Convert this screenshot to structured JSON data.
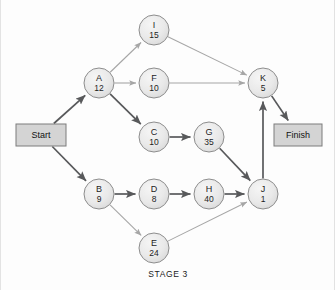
{
  "figure": {
    "caption": "STAGE 3",
    "width": 335,
    "height": 290,
    "background_color": "#fdfdfd",
    "node_fill_color": "#e8e8e8",
    "node_stroke_color": "#8d8d8d",
    "terminal_fill_color": "#d4d4d4",
    "edge_light_color": "#a6a6a6",
    "edge_bold_color": "#58595b"
  },
  "terminals": [
    {
      "id": "start",
      "label": "Start",
      "x": 40,
      "y": 135,
      "w": 50,
      "h": 22
    },
    {
      "id": "finish",
      "label": "Finish",
      "x": 297,
      "y": 135,
      "w": 48,
      "h": 22
    }
  ],
  "nodes": [
    {
      "id": "I",
      "label": "I",
      "value": "15",
      "x": 153,
      "y": 30,
      "r": 15
    },
    {
      "id": "A",
      "label": "A",
      "value": "12",
      "x": 98,
      "y": 83,
      "r": 15
    },
    {
      "id": "F",
      "label": "F",
      "value": "10",
      "x": 153,
      "y": 83,
      "r": 15
    },
    {
      "id": "K",
      "label": "K",
      "value": "5",
      "x": 262,
      "y": 83,
      "r": 15
    },
    {
      "id": "C",
      "label": "C",
      "value": "10",
      "x": 153,
      "y": 137,
      "r": 15
    },
    {
      "id": "G",
      "label": "G",
      "value": "35",
      "x": 208,
      "y": 137,
      "r": 15
    },
    {
      "id": "B",
      "label": "B",
      "value": "9",
      "x": 98,
      "y": 194,
      "r": 15
    },
    {
      "id": "D",
      "label": "D",
      "value": "8",
      "x": 153,
      "y": 194,
      "r": 15
    },
    {
      "id": "H",
      "label": "H",
      "value": "40",
      "x": 208,
      "y": 194,
      "r": 15
    },
    {
      "id": "J",
      "label": "J",
      "value": "1",
      "x": 262,
      "y": 194,
      "r": 15
    },
    {
      "id": "E",
      "label": "E",
      "value": "24",
      "x": 153,
      "y": 248,
      "r": 15
    }
  ],
  "edges": [
    {
      "from": "start",
      "to": "A",
      "weight": "bold"
    },
    {
      "from": "start",
      "to": "B",
      "weight": "bold"
    },
    {
      "from": "A",
      "to": "I",
      "weight": "light"
    },
    {
      "from": "A",
      "to": "F",
      "weight": "light"
    },
    {
      "from": "A",
      "to": "C",
      "weight": "bold"
    },
    {
      "from": "I",
      "to": "K",
      "weight": "light"
    },
    {
      "from": "F",
      "to": "K",
      "weight": "light"
    },
    {
      "from": "C",
      "to": "G",
      "weight": "bold"
    },
    {
      "from": "G",
      "to": "J",
      "weight": "bold"
    },
    {
      "from": "B",
      "to": "D",
      "weight": "bold"
    },
    {
      "from": "B",
      "to": "E",
      "weight": "light"
    },
    {
      "from": "D",
      "to": "H",
      "weight": "bold"
    },
    {
      "from": "H",
      "to": "J",
      "weight": "bold"
    },
    {
      "from": "E",
      "to": "J",
      "weight": "light"
    },
    {
      "from": "J",
      "to": "K",
      "weight": "bold"
    },
    {
      "from": "K",
      "to": "finish",
      "weight": "bold"
    }
  ]
}
